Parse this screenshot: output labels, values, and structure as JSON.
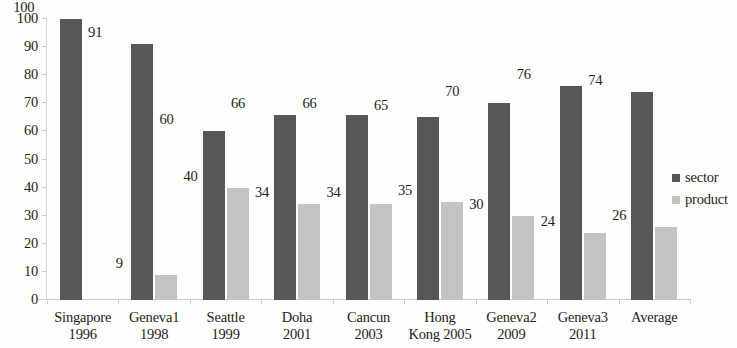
{
  "chart_data": {
    "type": "bar",
    "title": "",
    "subtitle": "",
    "xlabel": "",
    "ylabel": "",
    "ylim": [
      0,
      100
    ],
    "yticks": [
      0,
      10,
      20,
      30,
      40,
      50,
      60,
      70,
      80,
      90,
      100
    ],
    "grid": false,
    "legend_position": "right",
    "categories": [
      "Singapore 1996",
      "Geneva1 1998",
      "Seattle 1999",
      "Doha 2001",
      "Cancun 2003",
      "Hong Kong 2005",
      "Geneva2 2009",
      "Geneva3 2011",
      "Average"
    ],
    "category_lines": [
      [
        "Singapore",
        "1996"
      ],
      [
        "Geneva1",
        "1998"
      ],
      [
        "Seattle",
        "1999"
      ],
      [
        "Doha",
        "2001"
      ],
      [
        "Cancun",
        "2003"
      ],
      [
        "Hong",
        "Kong 2005"
      ],
      [
        "Geneva2",
        "2009"
      ],
      [
        "Geneva3",
        "2011"
      ],
      [
        "Average"
      ]
    ],
    "series": [
      {
        "name": "sector",
        "color": "#575756",
        "values": [
          100,
          91,
          60,
          66,
          66,
          65,
          70,
          76,
          74
        ],
        "labels": [
          "100",
          "91",
          "60",
          "66",
          "66",
          "65",
          "70",
          "76",
          "74"
        ]
      },
      {
        "name": "product",
        "color": "#c4c3c1",
        "values": [
          0,
          9,
          40,
          34,
          34,
          35,
          30,
          24,
          26
        ],
        "labels": [
          "",
          "9",
          "40",
          "34",
          "34",
          "35",
          "30",
          "24",
          "26"
        ]
      }
    ]
  },
  "legend": {
    "items": [
      {
        "label": "sector",
        "color": "#575756"
      },
      {
        "label": "product",
        "color": "#c4c3c1"
      }
    ]
  },
  "axis": {
    "y_tick_labels": [
      "100",
      "90",
      "80",
      "70",
      "60",
      "50",
      "40",
      "30",
      "20",
      "10",
      "0"
    ]
  }
}
